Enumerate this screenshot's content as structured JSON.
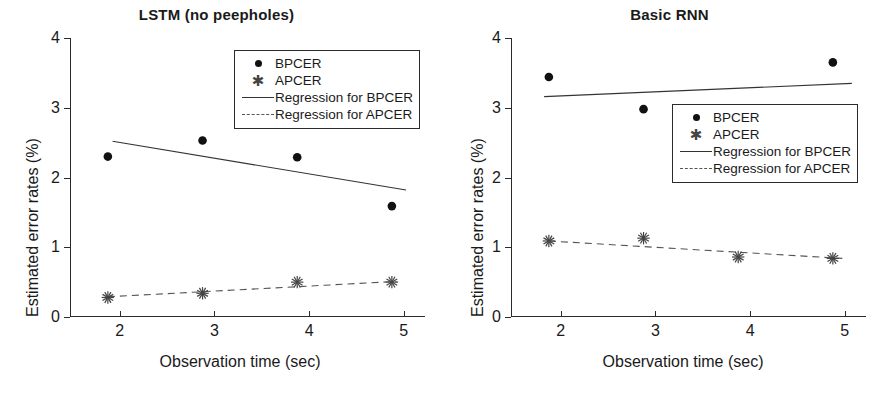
{
  "figure": {
    "width": 886,
    "height": 397,
    "background": "#ffffff",
    "panel_count": 2
  },
  "legend_labels": {
    "bpcer": "BPCER",
    "apcer": "APCER",
    "reg_bpcer": "Regression for BPCER",
    "reg_apcer": "Regression for APCER"
  },
  "icons": {
    "bpcer_marker": "filled-circle-marker",
    "apcer_marker": "asterisk-marker",
    "reg_bpcer_key": "solid-line-key",
    "reg_apcer_key": "dashed-line-key"
  },
  "colors": {
    "axis": "#2b2b2b",
    "bpcer_marker": "#111111",
    "apcer_marker": "#444444",
    "bpcer_regression": "#333333",
    "apcer_regression": "#555555",
    "background": "#ffffff"
  },
  "chart_data": [
    {
      "type": "scatter",
      "panel": "left",
      "title": "LSTM (no peepholes)",
      "xlabel": "Observation time (sec)",
      "ylabel": "Estimated error rates (%)",
      "x": [
        2,
        3,
        4,
        5
      ],
      "xticks": [
        2,
        3,
        4,
        5
      ],
      "xtick_labels": [
        "2",
        "3",
        "4",
        "5"
      ],
      "yticks": [
        0,
        1,
        2,
        3,
        4
      ],
      "ytick_labels": [
        "0",
        "1",
        "2",
        "3",
        "4"
      ],
      "xlim": [
        1.6,
        5.35
      ],
      "ylim": [
        0,
        4
      ],
      "grid": false,
      "legend_position": "top-right inside axes",
      "series": [
        {
          "name": "BPCER",
          "marker": "filled-circle",
          "values": [
            2.3,
            2.53,
            2.29,
            1.59
          ]
        },
        {
          "name": "APCER",
          "marker": "asterisk",
          "values": [
            0.28,
            0.34,
            0.5,
            0.5
          ]
        },
        {
          "name": "Regression for BPCER",
          "marker": "solid-line",
          "endpoints_x": [
            2.05,
            5.15
          ],
          "endpoints_y": [
            2.52,
            1.82
          ]
        },
        {
          "name": "Regression for APCER",
          "marker": "dashed-line",
          "endpoints_x": [
            2.0,
            5.05
          ],
          "endpoints_y": [
            0.29,
            0.51
          ]
        }
      ]
    },
    {
      "type": "scatter",
      "panel": "right",
      "title": "Basic RNN",
      "xlabel": "Observation time (sec)",
      "ylabel": "Estimated error rates (%)",
      "x": [
        2,
        3,
        4,
        5
      ],
      "xticks": [
        2,
        3,
        4,
        5
      ],
      "xtick_labels": [
        "2",
        "3",
        "4",
        "5"
      ],
      "yticks": [
        0,
        1,
        2,
        3,
        4
      ],
      "ytick_labels": [
        "0",
        "1",
        "2",
        "3",
        "4"
      ],
      "xlim": [
        1.6,
        5.35
      ],
      "ylim": [
        0,
        4
      ],
      "grid": false,
      "legend_position": "center-right inside axes",
      "series": [
        {
          "name": "BPCER",
          "marker": "filled-circle",
          "values": [
            3.44,
            2.98,
            2.98,
            3.65
          ]
        },
        {
          "name": "APCER",
          "marker": "asterisk",
          "values": [
            1.09,
            1.13,
            0.86,
            0.84
          ]
        },
        {
          "name": "Regression for BPCER",
          "marker": "solid-line",
          "endpoints_x": [
            1.95,
            5.2
          ],
          "endpoints_y": [
            3.16,
            3.35
          ]
        },
        {
          "name": "Regression for APCER",
          "marker": "dashed-line",
          "endpoints_x": [
            2.0,
            5.1
          ],
          "endpoints_y": [
            1.09,
            0.84
          ]
        }
      ]
    }
  ]
}
